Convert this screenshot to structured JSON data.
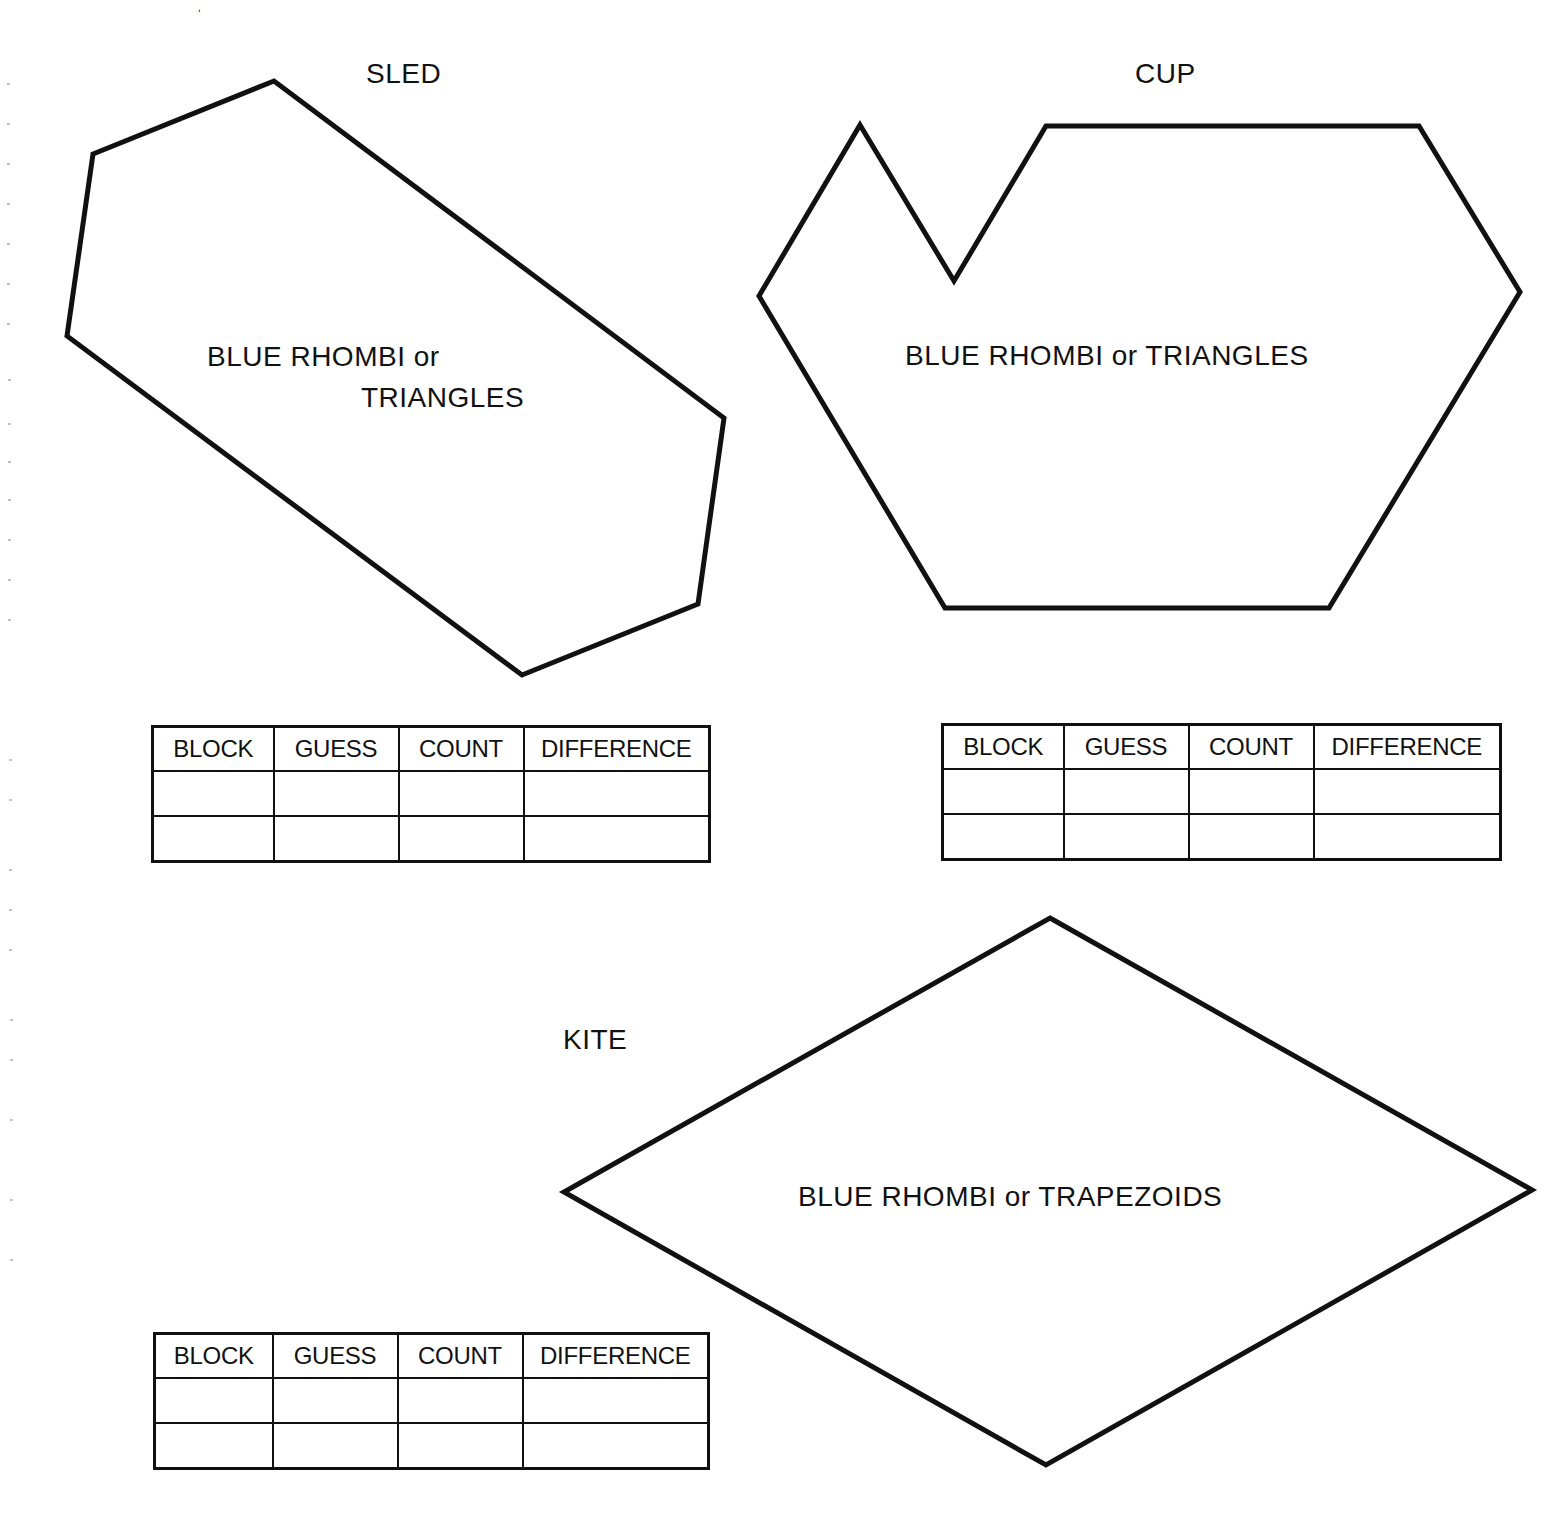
{
  "page": {
    "background": "#ffffff",
    "ink": "#111111"
  },
  "puzzles": [
    {
      "id": "sled",
      "title": "SLED",
      "fill_instruction_line1": "BLUE RHOMBI or",
      "fill_instruction_line2": "TRIANGLES",
      "outline_points": "93,154 274,81 724,418 698,604 522,675 67,336"
    },
    {
      "id": "cup",
      "title": "CUP",
      "fill_instruction": "BLUE RHOMBI or TRIANGLES",
      "outline_points": "860,125 954,281 1046,126 1419,126 1520,292 1329,608 945,608 759,296"
    },
    {
      "id": "kite",
      "title": "KITE",
      "fill_instruction": "BLUE RHOMBI or TRAPEZOIDS",
      "outline_points": "1050,918 1532,1190 1046,1465 564,1192"
    }
  ],
  "tables": {
    "headers": [
      "BLOCK",
      "GUESS",
      "COUNT",
      "DIFFERENCE"
    ],
    "sled_rows": [
      [
        "",
        "",
        "",
        ""
      ],
      [
        "",
        "",
        "",
        ""
      ]
    ],
    "cup_rows": [
      [
        "",
        "",
        "",
        ""
      ],
      [
        "",
        "",
        "",
        ""
      ]
    ],
    "kite_rows": [
      [
        "",
        "",
        "",
        ""
      ],
      [
        "",
        "",
        "",
        ""
      ]
    ]
  }
}
